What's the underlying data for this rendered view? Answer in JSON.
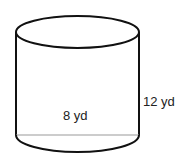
{
  "figure": {
    "shape": "cylinder",
    "diameter_label": "8 yd",
    "height_label": "12 yd",
    "stroke_color": "#111111",
    "diameter_line_color": "#999999"
  }
}
